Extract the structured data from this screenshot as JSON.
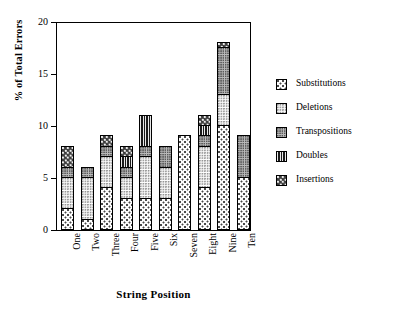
{
  "chart_data": {
    "type": "bar",
    "stacked": true,
    "title": "",
    "xlabel": "String Position",
    "ylabel": "% of Total Errors",
    "categories": [
      "One",
      "Two",
      "Three",
      "Four",
      "Five",
      "Six",
      "Seven",
      "Eight",
      "Nine",
      "Ten"
    ],
    "ylim": [
      0,
      20
    ],
    "yticks": [
      0,
      5,
      10,
      15,
      20
    ],
    "ytick_labels": [
      "0",
      "5",
      "10",
      "15",
      "20"
    ],
    "grid": false,
    "legend_position": "right",
    "series": [
      {
        "name": "Substitutions",
        "color": "#fdfdfd",
        "pattern": "sparse-dots",
        "values": [
          2,
          1,
          4,
          3,
          3,
          3,
          9,
          4,
          10,
          5
        ]
      },
      {
        "name": "Deletions",
        "color": "#f2f2f2",
        "pattern": "fine-dots",
        "values": [
          3,
          4,
          3,
          2,
          4,
          3,
          0,
          4,
          3,
          0
        ]
      },
      {
        "name": "Transpositions",
        "color": "#b9b9b9",
        "pattern": "medium-dots",
        "values": [
          1,
          1,
          1,
          1,
          1,
          2,
          0,
          1,
          4.5,
          4
        ]
      },
      {
        "name": "Doubles",
        "color": "#2b2b2b",
        "pattern": "vertical-stripes",
        "values": [
          0,
          0,
          0,
          1,
          3,
          0,
          0,
          1,
          0,
          0
        ]
      },
      {
        "name": "Insertions",
        "color": "#3a3a3a",
        "pattern": "dark-checker",
        "values": [
          2,
          0,
          1,
          1,
          0,
          0,
          0,
          1,
          0.5,
          0
        ]
      }
    ],
    "totals": [
      8,
      6,
      9,
      8,
      11,
      8,
      9,
      11,
      18,
      9
    ]
  },
  "legend": {
    "entries": [
      {
        "label": "Substitutions"
      },
      {
        "label": "Deletions"
      },
      {
        "label": "Transpositions"
      },
      {
        "label": "Doubles"
      },
      {
        "label": "Insertions"
      }
    ]
  }
}
